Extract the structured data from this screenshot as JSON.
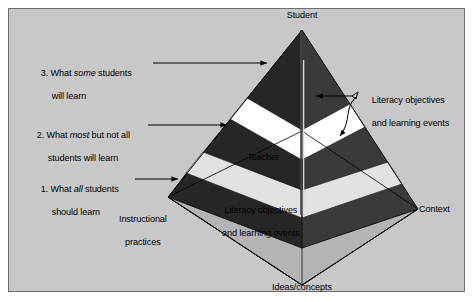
{
  "figure": {
    "type": "pyramid-diagram",
    "title_visible": false,
    "background_color": "#c8c8c8",
    "border_color": "#6e6e6e"
  },
  "vertices": {
    "apex_label": "Student",
    "left_label_line1": "Instructional",
    "left_label_line2": "practices",
    "right_label": "Context",
    "front_label": "Ideas/concepts"
  },
  "interior": {
    "teacher_label": "Teacher",
    "base_band_line1": "Literacy objectives",
    "base_band_line2": "and learning events"
  },
  "left_labels": [
    {
      "num": "3.",
      "pre": " What ",
      "em": "some",
      "post": " students",
      "line2": "will learn"
    },
    {
      "num": "2.",
      "pre": " What ",
      "em": "most",
      "post": " but not all",
      "line2": "students will learn"
    },
    {
      "num": "1.",
      "pre": " What ",
      "em": "all",
      "post": " students",
      "line2": "should learn"
    }
  ],
  "right_label": {
    "line1": "Literacy objectives",
    "line2": "and learning events"
  },
  "colors": {
    "dark_band": "#262626",
    "white_band": "#ffffff",
    "light_band": "#e2e2e2",
    "base_fill": "#b4b4b4",
    "outline": "#000000",
    "text": "#000000"
  }
}
